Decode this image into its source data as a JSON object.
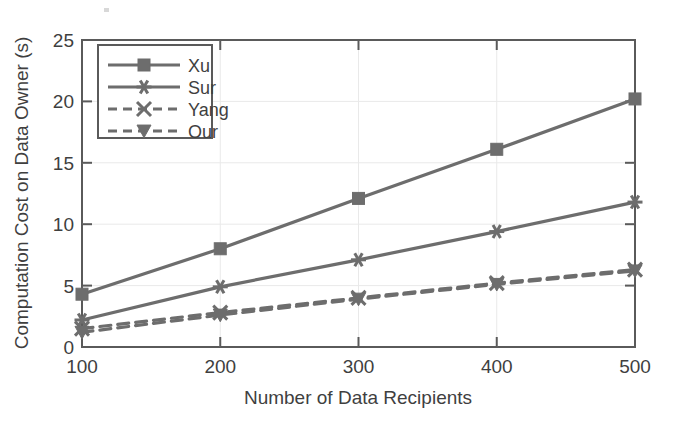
{
  "chart_data": {
    "type": "line",
    "title": "",
    "xlabel": "Number of Data Recipients",
    "ylabel": "Computation Cost on Data Owner (s)",
    "x": [
      100,
      200,
      300,
      400,
      500
    ],
    "xlim": [
      100,
      500
    ],
    "ylim": [
      0,
      25
    ],
    "xticks": [
      "100",
      "200",
      "300",
      "400",
      "500"
    ],
    "yticks": [
      "0",
      "5",
      "10",
      "15",
      "20",
      "25"
    ],
    "grid": false,
    "legend_position": "upper-left",
    "series": [
      {
        "name": "Xu",
        "values": [
          4.3,
          8.0,
          12.1,
          16.1,
          20.2
        ],
        "marker": "square-marker",
        "linestyle": "solid",
        "color": "#6d6d6d"
      },
      {
        "name": "Sur",
        "values": [
          2.2,
          4.9,
          7.1,
          9.4,
          11.8
        ],
        "marker": "asterisk-marker",
        "linestyle": "solid",
        "color": "#6d6d6d"
      },
      {
        "name": "Yang",
        "values": [
          1.5,
          2.8,
          4.0,
          5.2,
          6.3
        ],
        "marker": "x-cross-marker",
        "linestyle": "dashed",
        "color": "#6d6d6d"
      },
      {
        "name": "Our",
        "values": [
          1.2,
          2.6,
          3.9,
          5.1,
          6.2
        ],
        "marker": "triangle-down-marker",
        "linestyle": "dashed",
        "color": "#6d6d6d"
      }
    ]
  },
  "axes": {
    "x_title": "Number of Data Recipients",
    "y_title": "Computation Cost on Data Owner (s)",
    "x_tick_labels": [
      "100",
      "200",
      "300",
      "400",
      "500"
    ],
    "y_tick_labels": [
      "0",
      "5",
      "10",
      "15",
      "20",
      "25"
    ]
  },
  "legend": {
    "entries": [
      {
        "label": "Xu"
      },
      {
        "label": "Sur"
      },
      {
        "label": "Yang"
      },
      {
        "label": "Our"
      }
    ]
  },
  "colors": {
    "line": "#6d6d6d",
    "axis": "#555555",
    "text": "#3f3f3f",
    "background": "#ffffff"
  }
}
